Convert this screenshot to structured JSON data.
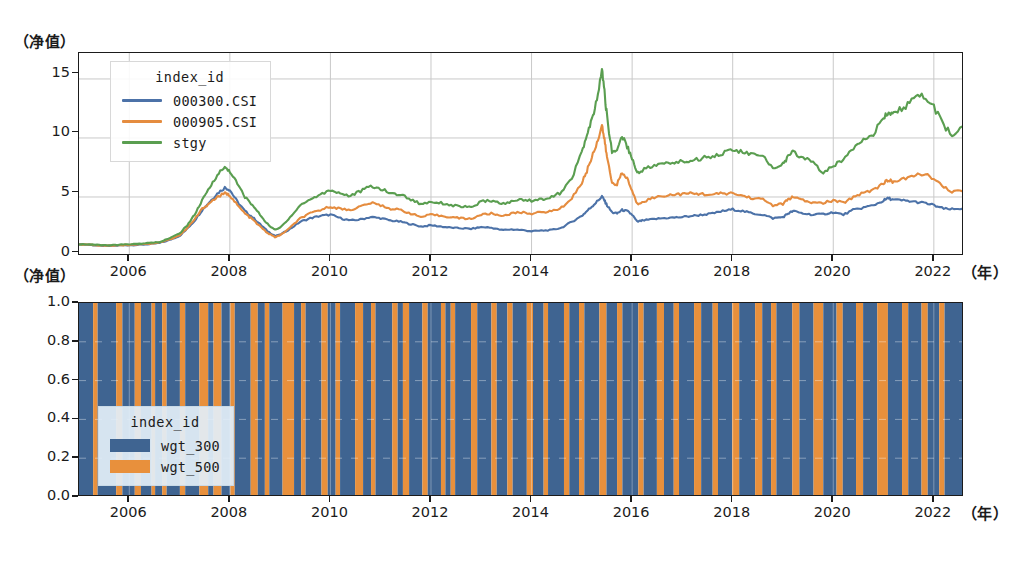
{
  "figure": {
    "top_ylabel": "（净值）",
    "bottom_ylabel": "（净值）",
    "top_xlabel": "（年）",
    "bottom_xlabel": "（年）"
  },
  "top_chart": {
    "yticks": [
      "0",
      "5",
      "10",
      "15"
    ],
    "xticks": [
      "2006",
      "2008",
      "2010",
      "2012",
      "2014",
      "2016",
      "2018",
      "2020",
      "2022"
    ],
    "legend": {
      "title": "index_id",
      "entries": [
        {
          "label": "000300.CSI",
          "color": "#4c72a8"
        },
        {
          "label": "000905.CSI",
          "color": "#e58c3f"
        },
        {
          "label": "stgy",
          "color": "#5a9e50"
        }
      ]
    }
  },
  "bottom_chart": {
    "yticks": [
      "0.0",
      "0.2",
      "0.4",
      "0.6",
      "0.8",
      "1.0"
    ],
    "xticks": [
      "2006",
      "2008",
      "2010",
      "2012",
      "2014",
      "2016",
      "2018",
      "2020",
      "2022"
    ],
    "legend": {
      "title": "index_id",
      "entries": [
        {
          "label": "wgt_300",
          "color": "#3f6491"
        },
        {
          "label": "wgt_500",
          "color": "#e8903c"
        }
      ]
    }
  },
  "chart_data": [
    {
      "type": "line",
      "title": "",
      "xlabel": "（年）",
      "ylabel": "（净值）",
      "xlim": [
        2005.0,
        2022.6
      ],
      "ylim": [
        0,
        17.2
      ],
      "yticks": [
        0,
        5,
        10,
        15
      ],
      "xticks": [
        2006,
        2008,
        2010,
        2012,
        2014,
        2016,
        2018,
        2020,
        2022
      ],
      "grid": true,
      "legend_position": "upper left",
      "legend_title": "index_id",
      "x": [
        2005.0,
        2005.2,
        2005.4,
        2005.6,
        2005.8,
        2006.0,
        2006.2,
        2006.4,
        2006.6,
        2006.8,
        2007.0,
        2007.15,
        2007.3,
        2007.45,
        2007.6,
        2007.75,
        2007.9,
        2008.0,
        2008.15,
        2008.3,
        2008.45,
        2008.6,
        2008.75,
        2008.9,
        2009.0,
        2009.2,
        2009.4,
        2009.6,
        2009.8,
        2010.0,
        2010.2,
        2010.4,
        2010.6,
        2010.8,
        2011.0,
        2011.2,
        2011.4,
        2011.6,
        2011.8,
        2012.0,
        2012.2,
        2012.4,
        2012.6,
        2012.8,
        2013.0,
        2013.2,
        2013.4,
        2013.6,
        2013.8,
        2014.0,
        2014.2,
        2014.4,
        2014.6,
        2014.8,
        2015.0,
        2015.1,
        2015.2,
        2015.3,
        2015.4,
        2015.45,
        2015.5,
        2015.6,
        2015.7,
        2015.8,
        2015.9,
        2016.0,
        2016.1,
        2016.2,
        2016.4,
        2016.6,
        2016.8,
        2017.0,
        2017.2,
        2017.4,
        2017.6,
        2017.8,
        2018.0,
        2018.2,
        2018.4,
        2018.6,
        2018.8,
        2019.0,
        2019.1,
        2019.2,
        2019.4,
        2019.6,
        2019.8,
        2020.0,
        2020.2,
        2020.4,
        2020.6,
        2020.8,
        2021.0,
        2021.1,
        2021.2,
        2021.4,
        2021.6,
        2021.8,
        2022.0,
        2022.2,
        2022.4,
        2022.6
      ],
      "series": [
        {
          "name": "000300.CSI",
          "color": "#4c72a8",
          "values": [
            1.0,
            0.95,
            0.88,
            0.85,
            0.9,
            0.92,
            0.95,
            1.0,
            1.1,
            1.35,
            1.7,
            2.3,
            3.0,
            3.9,
            4.6,
            5.3,
            5.8,
            5.6,
            4.6,
            3.8,
            3.3,
            2.7,
            2.1,
            1.7,
            1.8,
            2.3,
            2.9,
            3.2,
            3.4,
            3.5,
            3.2,
            3.0,
            3.1,
            3.3,
            3.2,
            3.0,
            2.9,
            2.7,
            2.5,
            2.6,
            2.5,
            2.4,
            2.35,
            2.3,
            2.45,
            2.4,
            2.2,
            2.25,
            2.2,
            2.1,
            2.15,
            2.2,
            2.4,
            2.9,
            3.4,
            3.8,
            4.2,
            4.6,
            5.05,
            4.7,
            4.3,
            3.7,
            3.6,
            3.9,
            3.8,
            3.5,
            2.9,
            3.0,
            3.1,
            3.2,
            3.25,
            3.3,
            3.4,
            3.5,
            3.6,
            3.8,
            3.95,
            3.8,
            3.6,
            3.5,
            3.2,
            3.3,
            3.6,
            3.8,
            3.6,
            3.5,
            3.55,
            3.7,
            3.5,
            3.9,
            4.1,
            4.3,
            4.7,
            4.9,
            4.75,
            4.7,
            4.6,
            4.5,
            4.3,
            4.0,
            3.95,
            4.05
          ]
        },
        {
          "name": "000905.CSI",
          "color": "#e58c3f",
          "values": [
            1.0,
            0.95,
            0.9,
            0.88,
            0.92,
            0.95,
            1.0,
            1.05,
            1.15,
            1.4,
            1.75,
            2.35,
            3.1,
            4.0,
            4.5,
            5.0,
            5.3,
            5.15,
            4.3,
            3.6,
            3.1,
            2.5,
            1.95,
            1.6,
            1.75,
            2.4,
            3.2,
            3.6,
            3.9,
            4.2,
            4.0,
            3.9,
            4.2,
            4.5,
            4.3,
            4.0,
            3.9,
            3.6,
            3.3,
            3.5,
            3.4,
            3.3,
            3.2,
            3.15,
            3.5,
            3.6,
            3.4,
            3.6,
            3.7,
            3.6,
            3.7,
            3.8,
            4.1,
            4.9,
            6.2,
            7.2,
            8.4,
            9.6,
            11.1,
            9.8,
            8.4,
            6.2,
            6.1,
            7.0,
            6.6,
            5.5,
            4.4,
            4.6,
            4.9,
            5.1,
            5.2,
            5.25,
            5.3,
            5.25,
            5.2,
            5.3,
            5.3,
            5.1,
            4.9,
            4.8,
            4.3,
            4.4,
            4.8,
            5.0,
            4.7,
            4.5,
            4.5,
            4.7,
            4.5,
            5.0,
            5.4,
            5.6,
            6.2,
            6.4,
            6.3,
            6.5,
            6.8,
            7.0,
            6.5,
            5.8,
            5.4,
            5.6
          ]
        },
        {
          "name": "stgy",
          "color": "#5a9e50",
          "values": [
            1.0,
            0.98,
            0.93,
            0.9,
            0.95,
            1.0,
            1.05,
            1.1,
            1.2,
            1.5,
            1.9,
            2.6,
            3.5,
            4.7,
            5.8,
            6.9,
            7.5,
            7.2,
            6.1,
            5.0,
            4.3,
            3.5,
            2.7,
            2.2,
            2.4,
            3.3,
            4.3,
            4.8,
            5.2,
            5.6,
            5.3,
            5.1,
            5.5,
            5.9,
            5.7,
            5.3,
            5.2,
            4.8,
            4.4,
            4.6,
            4.5,
            4.3,
            4.2,
            4.1,
            4.6,
            4.7,
            4.4,
            4.6,
            4.8,
            4.7,
            4.8,
            5.0,
            5.4,
            6.6,
            8.8,
            10.2,
            11.5,
            13.2,
            15.8,
            13.9,
            11.8,
            8.8,
            9.0,
            10.2,
            9.3,
            8.3,
            7.0,
            7.3,
            7.6,
            7.8,
            7.9,
            8.0,
            8.1,
            8.3,
            8.5,
            8.7,
            9.0,
            8.8,
            8.6,
            8.4,
            7.5,
            7.8,
            8.4,
            8.8,
            8.3,
            8.0,
            7.0,
            7.6,
            8.2,
            9.2,
            10.0,
            10.4,
            11.6,
            12.2,
            12.0,
            12.6,
            13.2,
            13.6,
            12.6,
            11.0,
            10.2,
            11.0
          ]
        }
      ]
    },
    {
      "type": "area",
      "title": "",
      "xlabel": "（年）",
      "ylabel": "（净值）",
      "xlim": [
        2005.0,
        2022.6
      ],
      "ylim": [
        0,
        1.0
      ],
      "yticks": [
        0.0,
        0.2,
        0.4,
        0.6,
        0.8,
        1.0
      ],
      "xticks": [
        2006,
        2008,
        2010,
        2012,
        2014,
        2016,
        2018,
        2020,
        2022
      ],
      "grid": true,
      "legend_position": "lower left",
      "legend_title": "index_id",
      "description": "Stacked weight allocation: each period allocates fully (weight 1.0) to either wgt_300 (blue) or wgt_500 (orange), producing vertical stripes.",
      "series": [
        {
          "name": "wgt_300",
          "color": "#3f6491"
        },
        {
          "name": "wgt_500",
          "color": "#e8903c"
        }
      ],
      "stripes": [
        [
          0.0,
          1.6,
          "b"
        ],
        [
          1.6,
          2.1,
          "o"
        ],
        [
          2.1,
          4.2,
          "b"
        ],
        [
          4.2,
          4.9,
          "o"
        ],
        [
          4.9,
          6.3,
          "b"
        ],
        [
          6.3,
          7.0,
          "o"
        ],
        [
          7.0,
          8.2,
          "b"
        ],
        [
          8.2,
          8.6,
          "o"
        ],
        [
          8.6,
          9.4,
          "b"
        ],
        [
          9.4,
          9.9,
          "o"
        ],
        [
          9.9,
          11.4,
          "b"
        ],
        [
          11.4,
          12.0,
          "o"
        ],
        [
          12.0,
          13.6,
          "b"
        ],
        [
          13.6,
          14.6,
          "o"
        ],
        [
          14.6,
          15.2,
          "b"
        ],
        [
          15.2,
          16.1,
          "o"
        ],
        [
          16.1,
          17.1,
          "b"
        ],
        [
          17.1,
          17.6,
          "o"
        ],
        [
          17.6,
          19.4,
          "b"
        ],
        [
          19.4,
          20.2,
          "o"
        ],
        [
          20.2,
          21.0,
          "b"
        ],
        [
          21.0,
          21.5,
          "o"
        ],
        [
          21.5,
          23.0,
          "b"
        ],
        [
          23.0,
          24.3,
          "o"
        ],
        [
          24.3,
          25.1,
          "b"
        ],
        [
          25.1,
          25.6,
          "o"
        ],
        [
          25.6,
          27.4,
          "b"
        ],
        [
          27.4,
          28.1,
          "o"
        ],
        [
          28.1,
          29.0,
          "b"
        ],
        [
          29.0,
          29.5,
          "o"
        ],
        [
          29.5,
          31.2,
          "b"
        ],
        [
          31.2,
          32.1,
          "o"
        ],
        [
          32.1,
          33.0,
          "b"
        ],
        [
          33.0,
          33.5,
          "o"
        ],
        [
          33.5,
          35.4,
          "b"
        ],
        [
          35.4,
          36.0,
          "o"
        ],
        [
          36.0,
          36.6,
          "b"
        ],
        [
          36.6,
          37.3,
          "o"
        ],
        [
          37.3,
          38.8,
          "b"
        ],
        [
          38.8,
          39.4,
          "o"
        ],
        [
          39.4,
          40.9,
          "b"
        ],
        [
          40.9,
          41.4,
          "o"
        ],
        [
          41.4,
          42.0,
          "b"
        ],
        [
          42.0,
          42.5,
          "o"
        ],
        [
          42.5,
          44.3,
          "b"
        ],
        [
          44.3,
          45.0,
          "o"
        ],
        [
          45.0,
          46.6,
          "b"
        ],
        [
          46.6,
          47.2,
          "o"
        ],
        [
          47.2,
          48.4,
          "b"
        ],
        [
          48.4,
          49.0,
          "o"
        ],
        [
          49.0,
          50.6,
          "b"
        ],
        [
          50.6,
          51.3,
          "o"
        ],
        [
          51.3,
          52.5,
          "b"
        ],
        [
          52.5,
          53.0,
          "o"
        ],
        [
          53.0,
          54.8,
          "b"
        ],
        [
          54.8,
          55.4,
          "o"
        ],
        [
          55.4,
          56.5,
          "b"
        ],
        [
          56.5,
          57.1,
          "o"
        ],
        [
          57.1,
          58.8,
          "b"
        ],
        [
          58.8,
          59.6,
          "o"
        ],
        [
          59.6,
          60.8,
          "b"
        ],
        [
          60.8,
          61.4,
          "o"
        ],
        [
          61.4,
          63.2,
          "b"
        ],
        [
          63.2,
          63.8,
          "o"
        ],
        [
          63.8,
          65.3,
          "b"
        ],
        [
          65.3,
          66.1,
          "o"
        ],
        [
          66.1,
          67.2,
          "b"
        ],
        [
          67.2,
          67.8,
          "o"
        ],
        [
          67.8,
          69.5,
          "b"
        ],
        [
          69.5,
          70.3,
          "o"
        ],
        [
          70.3,
          71.6,
          "b"
        ],
        [
          71.6,
          72.2,
          "o"
        ],
        [
          72.2,
          73.8,
          "b"
        ],
        [
          73.8,
          74.6,
          "o"
        ],
        [
          74.6,
          76.4,
          "b"
        ],
        [
          76.4,
          77.2,
          "o"
        ],
        [
          77.2,
          78.2,
          "b"
        ],
        [
          78.2,
          78.8,
          "o"
        ],
        [
          78.8,
          80.6,
          "b"
        ],
        [
          80.6,
          81.4,
          "o"
        ],
        [
          81.4,
          83.0,
          "b"
        ],
        [
          83.0,
          84.1,
          "o"
        ],
        [
          84.1,
          85.6,
          "b"
        ],
        [
          85.6,
          86.3,
          "o"
        ],
        [
          86.3,
          87.8,
          "b"
        ],
        [
          87.8,
          88.6,
          "o"
        ],
        [
          88.6,
          90.2,
          "b"
        ],
        [
          90.2,
          91.4,
          "o"
        ],
        [
          91.4,
          93.0,
          "b"
        ],
        [
          93.0,
          93.7,
          "o"
        ],
        [
          93.7,
          95.2,
          "b"
        ],
        [
          95.2,
          95.9,
          "o"
        ],
        [
          95.9,
          97.2,
          "b"
        ],
        [
          97.2,
          97.8,
          "o"
        ],
        [
          97.8,
          100.0,
          "b"
        ]
      ]
    }
  ]
}
